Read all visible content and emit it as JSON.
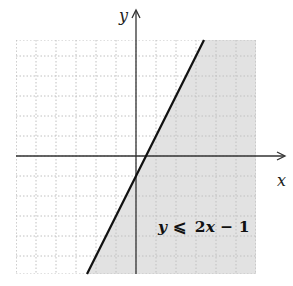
{
  "chart_data": {
    "type": "inequality-graph",
    "title": "",
    "xlabel": "x",
    "ylabel": "y",
    "inequality": {
      "label": "y ⩽ 2x − 1",
      "label_parts": {
        "lhs": "y",
        "op": "⩽",
        "rhs_coef": "2",
        "rhs_var": "x",
        "rhs_const": " − 1"
      },
      "boundary": {
        "slope": 2,
        "intercept": -1,
        "style": "solid"
      },
      "shaded_side": "below"
    },
    "boundary_points": [
      [
        0,
        -1
      ],
      [
        0.5,
        0
      ],
      [
        1,
        1
      ],
      [
        2,
        3
      ],
      [
        3,
        5
      ]
    ],
    "xlim": [
      -6,
      6
    ],
    "ylim": [
      -6,
      6
    ],
    "grid": {
      "on": true,
      "step": 1,
      "style": "dotted"
    },
    "tick_labels": "none",
    "legend": "none"
  },
  "colors": {
    "shade": "#e2e2e2",
    "grid_unshaded": "#c4c4c4",
    "grid_shaded": "#b4b4b4",
    "axis": "#333333",
    "boundary": "#111111",
    "background": "#ffffff"
  }
}
